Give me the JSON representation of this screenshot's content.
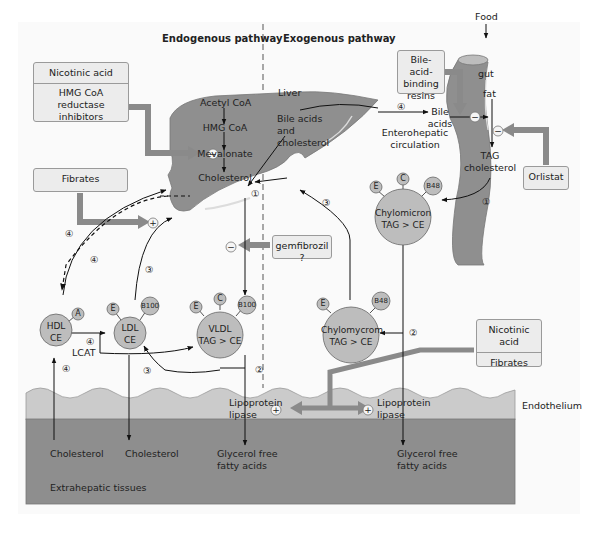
{
  "headers": {
    "endogenous": "Endogenous pathway",
    "exogenous": "Exogenous pathway"
  },
  "drugs": {
    "nicotinic_top": "Nicotinic acid",
    "hmg_inhibitors": "HMG CoA reductase inhibitors",
    "fibrates_top": "Fibrates",
    "gemfibrozil": "gemfibrozil ?",
    "bile_resins": "Bile-acid-binding resins",
    "orlistat": "Orlistat",
    "nicotinic_bottom": "Nicotinic acid",
    "fibrates_bottom": "Fibrates"
  },
  "liver": {
    "label": "Liver",
    "acetyl_coa": "Acetyl CoA",
    "hmg_coa": "HMG CoA",
    "mevalonate": "Mevalonate",
    "cholesterol": "Cholesterol",
    "bile_acids_chol": "Bile acids and cholesterol"
  },
  "gut": {
    "food": "Food",
    "gut": "gut",
    "fat": "fat",
    "tag": "TAG",
    "cholesterol": "cholesterol",
    "bile_acids": "Bile acids",
    "enterohepatic": "Enterohepatic circulation"
  },
  "particles": {
    "hdl": {
      "line1": "HDL",
      "line2": "CE",
      "apo": [
        "A"
      ]
    },
    "ldl": {
      "line1": "LDL",
      "line2": "CE",
      "apo": [
        "E",
        "B100"
      ]
    },
    "vldl": {
      "line1": "VLDL",
      "line2": "TAG > CE",
      "apo": [
        "E",
        "C",
        "B100"
      ]
    },
    "chylomicron": {
      "line1": "Chylomicron",
      "line2": "TAG > CE",
      "apo": [
        "E",
        "C",
        "B48"
      ]
    },
    "chylomicron_remnant": {
      "line1": "Chylomycrom",
      "line2": "TAG > CE",
      "apo": [
        "E",
        "B48"
      ]
    }
  },
  "labels": {
    "lcat": "LCAT",
    "lipoprotein_lipase": "Lipoprotein lipase",
    "endothelium": "Endothelium",
    "extrahepatic": "Extrahepatic tissues",
    "cholesterol_in": "Cholesterol",
    "cholesterol_out": "Cholesterol",
    "glycerol_ffa": "Glycerol free fatty acids"
  },
  "step_numbers": [
    "①",
    "②",
    "③",
    "④"
  ],
  "symbols": {
    "minus": "−",
    "plus": "+"
  },
  "colors": {
    "tissue_dark": "#8d8d8d",
    "endothelium": "#c9c9c9",
    "organ": "#8f8f8f",
    "particle": "#bdbdbd",
    "drug_arrow": "#8a8a8a",
    "box_fill": "#ececec"
  }
}
